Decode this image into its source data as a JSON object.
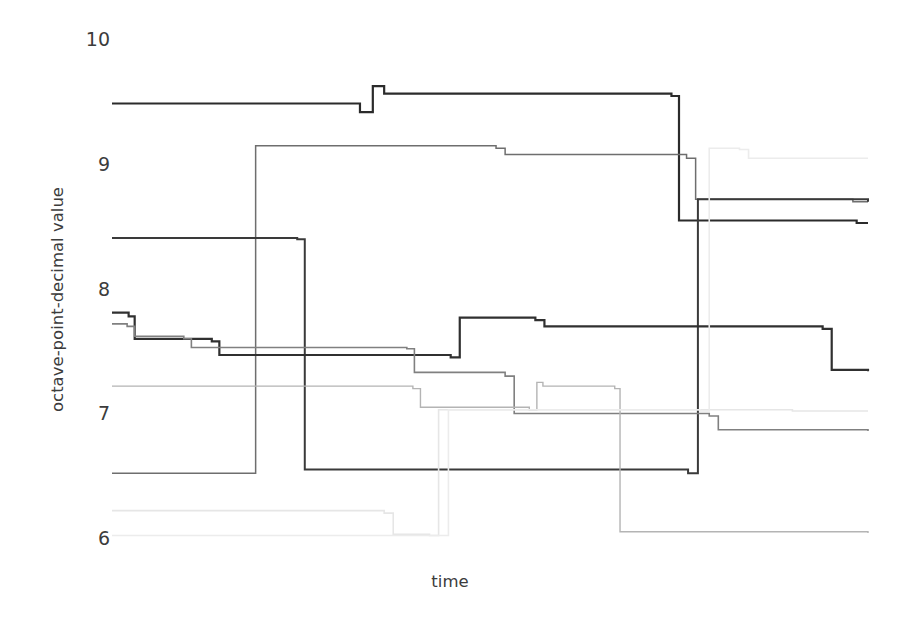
{
  "chart_data": {
    "type": "line",
    "title": "",
    "subtitle": "",
    "xlabel": "time",
    "ylabel": "octave-point-decimal value",
    "grid": false,
    "legend": "none",
    "line_style": "step-post",
    "xlim": [
      0,
      1
    ],
    "ylim": [
      5.95,
      10.1
    ],
    "y_ticks": [
      6,
      7,
      8,
      9,
      10
    ],
    "y_tick_labels": [
      "6",
      "7",
      "8",
      "9",
      "10"
    ],
    "x_ticks": [],
    "x_tick_labels": [],
    "note": "Eight step-function series of octave-point-decimal values over unlabeled time; line darkness varies per series.",
    "series": [
      {
        "name": "series-1-top-dark",
        "color": "#2b2b2b",
        "width": 2.2,
        "x": [
          0.0,
          0.328,
          0.345,
          0.36,
          0.74,
          0.75,
          0.985,
          1.0
        ],
        "y": [
          9.49,
          9.42,
          9.63,
          9.57,
          9.55,
          8.55,
          8.53,
          8.53
        ]
      },
      {
        "name": "series-2-upper-mid-gray",
        "color": "#6e6e6e",
        "width": 1.5,
        "x": [
          0.0,
          0.185,
          0.19,
          0.508,
          0.52,
          0.76,
          0.772,
          0.98,
          1.0
        ],
        "y": [
          6.52,
          6.52,
          9.15,
          9.13,
          9.08,
          9.05,
          8.72,
          8.7,
          8.7
        ]
      },
      {
        "name": "series-3-second-dark",
        "color": "#3a3a3a",
        "width": 2.0,
        "x": [
          0.0,
          0.245,
          0.255,
          0.762,
          0.775,
          1.0
        ],
        "y": [
          8.41,
          8.4,
          6.55,
          6.52,
          8.72,
          8.7
        ]
      },
      {
        "name": "series-4-mid-dark-step",
        "color": "#303030",
        "width": 2.2,
        "x": [
          0.0,
          0.022,
          0.03,
          0.132,
          0.142,
          0.448,
          0.46,
          0.56,
          0.572,
          0.94,
          0.952,
          1.0
        ],
        "y": [
          7.81,
          7.78,
          7.6,
          7.58,
          7.47,
          7.45,
          7.77,
          7.75,
          7.7,
          7.68,
          7.35,
          7.34
        ]
      },
      {
        "name": "series-5-mid-gray-step",
        "color": "#808080",
        "width": 1.6,
        "x": [
          0.0,
          0.02,
          0.03,
          0.095,
          0.105,
          0.39,
          0.4,
          0.52,
          0.532,
          0.79,
          0.802,
          1.0
        ],
        "y": [
          7.72,
          7.7,
          7.62,
          7.6,
          7.53,
          7.52,
          7.33,
          7.3,
          7.0,
          6.98,
          6.87,
          6.86
        ]
      },
      {
        "name": "series-6-light-gray-lower",
        "color": "#b4b4b4",
        "width": 1.4,
        "x": [
          0.0,
          0.398,
          0.408,
          0.552,
          0.562,
          0.57,
          0.665,
          0.672,
          1.0
        ],
        "y": [
          7.22,
          7.2,
          7.05,
          7.03,
          7.25,
          7.22,
          7.2,
          6.05,
          6.04
        ]
      },
      {
        "name": "series-7-very-light-bottom",
        "color": "#e6e6e6",
        "width": 1.6,
        "x": [
          0.0,
          0.36,
          0.372,
          0.42,
          0.432,
          0.9,
          0.912,
          1.0
        ],
        "y": [
          6.22,
          6.2,
          6.03,
          6.02,
          7.03,
          7.02,
          7.02,
          7.02
        ]
      },
      {
        "name": "series-8-very-light-top-right",
        "color": "#ececec",
        "width": 1.6,
        "x": [
          0.0,
          0.432,
          0.445,
          0.778,
          0.79,
          0.83,
          0.842,
          1.0
        ],
        "y": [
          6.02,
          6.02,
          7.03,
          7.02,
          9.13,
          9.12,
          9.05,
          9.05
        ]
      }
    ]
  },
  "axes": {
    "y_title": "octave-point-decimal value",
    "x_title": "time",
    "y_tick_labels": [
      "10",
      "9",
      "8",
      "7",
      "6"
    ]
  },
  "colors": {
    "background": "#ffffff",
    "text": "#3c3c3c",
    "darkest_line": "#2b2b2b",
    "lightest_line": "#ececec"
  }
}
